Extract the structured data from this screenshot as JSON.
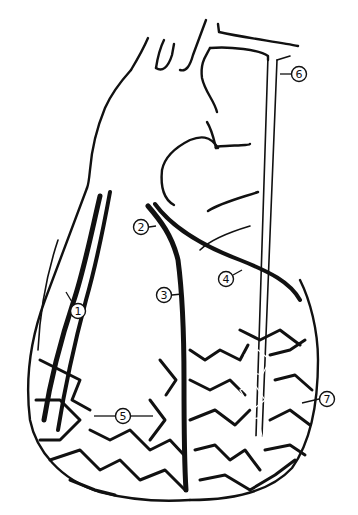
{
  "diagram": {
    "type": "anatomical-line-drawing",
    "background_color": "#ffffff",
    "ink_color": "#111111",
    "labels": [
      {
        "id": "1",
        "text": "1",
        "x": 78,
        "y": 311,
        "pointer": "arrow to left coronary wall vessel"
      },
      {
        "id": "2",
        "text": "2",
        "x": 141,
        "y": 227,
        "pointer": "arrow to coronary vessel origin"
      },
      {
        "id": "3",
        "text": "3",
        "x": 164,
        "y": 295,
        "pointer": "arrow to descending vessel"
      },
      {
        "id": "4",
        "text": "4",
        "x": 226,
        "y": 279,
        "pointer": "arrow to circumflex branch"
      },
      {
        "id": "5",
        "text": "5",
        "x": 123,
        "y": 416,
        "pointer": "double arrow across ventricular network"
      },
      {
        "id": "6",
        "text": "6",
        "x": 299,
        "y": 74,
        "pointer": "arrow to catheter tube"
      },
      {
        "id": "7",
        "text": "7",
        "x": 327,
        "y": 399,
        "pointer": "line to catheter tip region"
      }
    ]
  }
}
